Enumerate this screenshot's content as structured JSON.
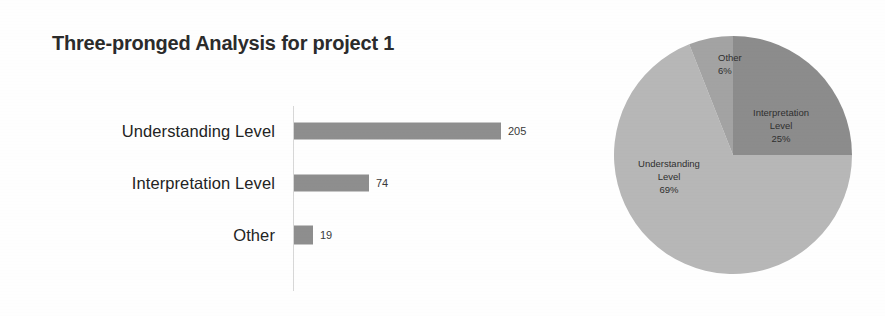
{
  "title": "Three-pronged Analysis for project 1",
  "chart_data": [
    {
      "type": "bar",
      "orientation": "horizontal",
      "title": "Three-pronged Analysis for project 1",
      "categories": [
        "Understanding Level",
        "Interpretation Level",
        "Other"
      ],
      "values": [
        205,
        74,
        19
      ],
      "value_labels": [
        "205",
        "74",
        "19"
      ],
      "xlabel": "",
      "ylabel": "",
      "xlim": [
        0,
        230
      ],
      "grid": false,
      "legend": "none",
      "series_color": "#8e8e8e"
    },
    {
      "type": "pie",
      "title": "",
      "labels": [
        "Interpretation Level",
        "Understanding Level",
        "Other"
      ],
      "values": [
        25,
        69,
        6
      ],
      "percent_labels": [
        "25%",
        "69%",
        "6%"
      ],
      "start_angle_deg": 0,
      "direction": "clockwise",
      "colors": [
        "#8c8c8c",
        "#b7b7b7",
        "#a3a3a3"
      ],
      "legend": "none",
      "labels_inside": true
    }
  ],
  "bar_chart": {
    "rows": [
      {
        "label": "Understanding Level",
        "value": "205"
      },
      {
        "label": "Interpretation Level",
        "value": "74"
      },
      {
        "label": "Other",
        "value": "19"
      }
    ]
  },
  "pie_chart": {
    "slices": [
      {
        "name": "other",
        "line1": "Other",
        "line2": "",
        "percent": "6%"
      },
      {
        "name": "interpretation",
        "line1": "Interpretation",
        "line2": "Level",
        "percent": "25%"
      },
      {
        "name": "understanding",
        "line1": "Understanding",
        "line2": "Level",
        "percent": "69%"
      }
    ]
  },
  "colors": {
    "bar": "#8e8e8e",
    "pie_interpretation": "#8c8c8c",
    "pie_understanding": "#b7b7b7",
    "pie_other": "#a3a3a3",
    "text": "#232323",
    "axis": "#d7d7d7"
  }
}
